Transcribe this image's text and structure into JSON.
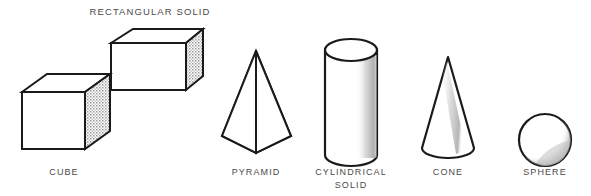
{
  "figure": {
    "title": "RECTANGULAR SOLID",
    "background_color": "#ffffff",
    "line_color": "#1a1a1a",
    "shade_color": "#bdbdbd",
    "label_color": "#4a4a4a",
    "width": 591,
    "height": 196
  },
  "labels": {
    "rectangular_solid": "RECTANGULAR SOLID",
    "cube": "CUBE",
    "pyramid": "PYRAMID",
    "cylindrical_solid_line1": "CYLINDRICAL",
    "cylindrical_solid_line2": "SOLID",
    "cone": "CONE",
    "sphere": "SPHERE"
  },
  "shapes": [
    {
      "name": "rectangular-solid",
      "label": "RECTANGULAR SOLID",
      "type": "rectangular-prism",
      "shaded_face": "right",
      "center_x": 157,
      "center_y": 59
    },
    {
      "name": "cube",
      "label": "CUBE",
      "type": "cube",
      "shaded_face": "right",
      "center_x": 65,
      "center_y": 110
    },
    {
      "name": "pyramid",
      "label": "PYRAMID",
      "type": "square-pyramid",
      "shaded_face": "right",
      "center_x": 256,
      "center_y": 105
    },
    {
      "name": "cylindrical-solid",
      "label": "CYLINDRICAL SOLID",
      "type": "cylinder",
      "shaded_face": "right-curve",
      "center_x": 351,
      "center_y": 102
    },
    {
      "name": "cone",
      "label": "CONE",
      "type": "cone",
      "shaded_face": "right-curve",
      "center_x": 448,
      "center_y": 105
    },
    {
      "name": "sphere",
      "label": "SPHERE",
      "type": "sphere",
      "shaded_face": "lower-right-crescent",
      "center_x": 545,
      "center_y": 140
    }
  ]
}
